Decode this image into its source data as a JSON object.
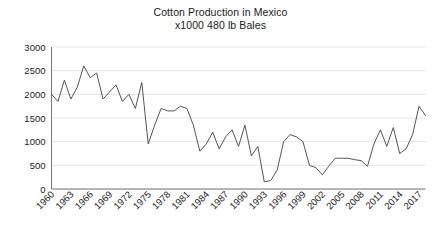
{
  "chart_data": {
    "type": "line",
    "title": "Cotton Production in Mexico",
    "subtitle": "x1000 480 lb Bales",
    "xlabel": "",
    "ylabel": "",
    "ylim": [
      0,
      3000
    ],
    "xlim": [
      1960,
      2018
    ],
    "yticks": [
      0,
      500,
      1000,
      1500,
      2000,
      2500,
      3000
    ],
    "ytick_labels": [
      "0",
      "500",
      "1000",
      "1500",
      "2000",
      "2500",
      "3000"
    ],
    "xticks": [
      1960,
      1963,
      1966,
      1969,
      1972,
      1975,
      1978,
      1981,
      1984,
      1987,
      1990,
      1993,
      1996,
      1999,
      2002,
      2005,
      2008,
      2011,
      2014,
      2017
    ],
    "xtick_labels": [
      "1960",
      "1963",
      "1966",
      "1969",
      "1972",
      "1975",
      "1978",
      "1981",
      "1984",
      "1987",
      "1990",
      "1993",
      "1996",
      "1999",
      "2002",
      "2005",
      "2008",
      "2011",
      "2014",
      "2017"
    ],
    "grid": true,
    "grid_axis": "y",
    "legend": false,
    "line_color": "#555555",
    "grid_color": "#e4e4e4",
    "axis_color": "#7a7a7a",
    "x": [
      1960,
      1961,
      1962,
      1963,
      1964,
      1965,
      1966,
      1967,
      1968,
      1969,
      1970,
      1971,
      1972,
      1973,
      1974,
      1975,
      1976,
      1977,
      1978,
      1979,
      1980,
      1981,
      1982,
      1983,
      1984,
      1985,
      1986,
      1987,
      1988,
      1989,
      1990,
      1991,
      1992,
      1993,
      1994,
      1995,
      1996,
      1997,
      1998,
      1999,
      2000,
      2001,
      2002,
      2003,
      2004,
      2005,
      2006,
      2007,
      2008,
      2009,
      2010,
      2011,
      2012,
      2013,
      2014,
      2015,
      2016,
      2017,
      2018
    ],
    "values": [
      2000,
      1850,
      2300,
      1900,
      2150,
      2600,
      2350,
      2450,
      1900,
      2050,
      2200,
      1850,
      2000,
      1700,
      2250,
      950,
      1350,
      1700,
      1650,
      1650,
      1750,
      1700,
      1350,
      800,
      950,
      1200,
      850,
      1100,
      1250,
      900,
      1350,
      700,
      900,
      150,
      180,
      400,
      1000,
      1150,
      1100,
      1000,
      500,
      450,
      300,
      480,
      650,
      650,
      650,
      620,
      600,
      480,
      950,
      1250,
      900,
      1300,
      750,
      850,
      1150,
      1750,
      1550
    ]
  }
}
